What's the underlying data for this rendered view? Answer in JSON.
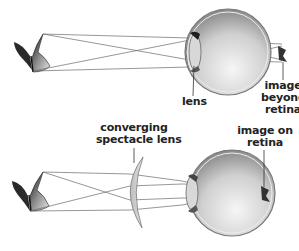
{
  "figure": {
    "top_panel": {
      "description": "Farsighted eye without correction",
      "labels": {
        "lens": "lens",
        "image_line1": "image",
        "image_line2": "beyond",
        "image_line3": "retina"
      }
    },
    "bottom_panel": {
      "description": "Farsighted eye corrected with converging spectacle lens",
      "labels": {
        "spectacle_line1": "converging",
        "spectacle_line2": "spectacle lens",
        "image_line1": "image on",
        "image_line2": "retina"
      }
    },
    "icons": {
      "object": "butterfly-icon",
      "eye": "eyeball-icon",
      "corrective_lens": "converging-lens-icon"
    },
    "colors": {
      "background": "#ffffff",
      "ray": "#6a6a6a",
      "text": "#222222",
      "eye_shade_dark": "#8a8a8a",
      "eye_shade_light": "#f4f4f4",
      "lens_fill": "#cfcfcf"
    }
  }
}
